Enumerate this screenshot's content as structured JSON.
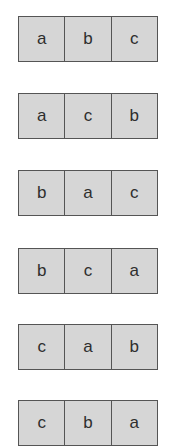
{
  "diagram": {
    "rows": [
      {
        "cells": [
          "a",
          "b",
          "c"
        ]
      },
      {
        "cells": [
          "a",
          "c",
          "b"
        ]
      },
      {
        "cells": [
          "b",
          "a",
          "c"
        ]
      },
      {
        "cells": [
          "b",
          "c",
          "a"
        ]
      },
      {
        "cells": [
          "c",
          "a",
          "b"
        ]
      },
      {
        "cells": [
          "c",
          "b",
          "a"
        ]
      }
    ]
  },
  "colors": {
    "cell_fill": "#d6d6d6",
    "border": "#555555",
    "text": "#2e2e2e",
    "background": "#ffffff"
  }
}
